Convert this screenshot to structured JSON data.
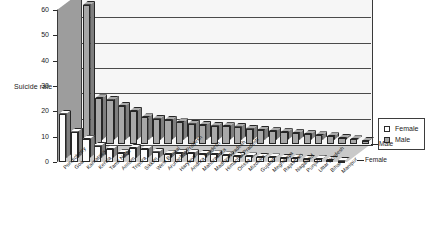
{
  "chart_data": {
    "type": "bar",
    "title": "",
    "subtitle": "",
    "xlabel": "",
    "ylabel": "Suicide rate",
    "ylim": [
      0,
      60
    ],
    "yticks": [
      0,
      10,
      20,
      30,
      40,
      50,
      60
    ],
    "grid": true,
    "legend_position": "right",
    "projection": "3d-clustered-rows",
    "row_labels": [
      "Male",
      "Female"
    ],
    "categories": [
      "Pondicherry",
      "Goa",
      "Karnataka",
      "Kerala",
      "Tamil Nadu",
      "Assam",
      "Tripura",
      "Sikkim",
      "West Bengal",
      "Arunachal Pradesh",
      "Haryana",
      "Andhra Pradesh",
      "Maharashtra",
      "Madhya Pradesh",
      "Himachal Pradesh",
      "Orissa",
      "Mizoram",
      "Gujarat",
      "Meghalaya",
      "Rajasthan",
      "Nagaland",
      "Punjab",
      "Uttar Pradesh",
      "Bihar",
      "Manipur"
    ],
    "series": [
      {
        "name": "Male",
        "color": "#a8a8a8",
        "values": [
          55.0,
          18.0,
          17.5,
          15.0,
          13.0,
          10.5,
          10.0,
          9.5,
          8.5,
          8.0,
          7.5,
          7.2,
          7.0,
          6.8,
          6.0,
          5.5,
          5.0,
          4.6,
          4.2,
          3.8,
          3.4,
          3.0,
          2.4,
          1.8,
          1.2
        ]
      },
      {
        "name": "Female",
        "color": "#fcfcfc",
        "values": [
          19.0,
          12.0,
          9.0,
          6.5,
          5.0,
          3.5,
          5.5,
          5.0,
          4.0,
          3.0,
          3.5,
          3.5,
          3.2,
          3.0,
          2.6,
          2.4,
          2.2,
          2.0,
          1.8,
          1.6,
          1.4,
          1.2,
          1.0,
          0.8,
          0.5
        ]
      }
    ]
  },
  "legend": {
    "entries": [
      {
        "label": "Female",
        "swatch": "legend-swatch-female"
      },
      {
        "label": "Male",
        "swatch": "legend-swatch-male"
      }
    ]
  },
  "series_axis_labels": {
    "back": "Male",
    "front": "Female"
  }
}
